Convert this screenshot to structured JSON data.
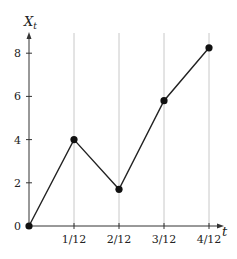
{
  "chart_data": {
    "type": "line",
    "title": "",
    "xlabel": "t",
    "ylabel": "X_t",
    "ylabel_main": "X",
    "ylabel_sub": "t",
    "x": [
      0,
      0.08333,
      0.16667,
      0.25,
      0.33333
    ],
    "x_tick_labels": [
      "1/12",
      "2/12",
      "3/12",
      "4/12"
    ],
    "y_tick_labels": [
      "0",
      "2",
      "4",
      "6",
      "8"
    ],
    "series": [
      {
        "name": "X_t",
        "values": [
          0,
          4.0,
          1.7,
          5.8,
          8.25
        ]
      }
    ],
    "xlim": [
      0,
      0.3333
    ],
    "ylim": [
      0,
      9
    ],
    "grid": "vertical gridlines at each x tick",
    "markers": true,
    "colors": {
      "line": "#222222",
      "marker": "#111111",
      "grid": "#c8c8c8",
      "axis": "#333333"
    }
  }
}
